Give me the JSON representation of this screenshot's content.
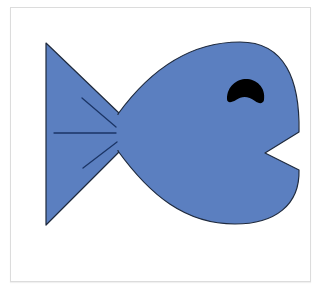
{
  "illustration": {
    "subject": "fish",
    "description": "Blue cartoon fish facing right with open mouth and black eye",
    "colors": {
      "body_fill": "#5b7fc0",
      "outline": "#1f2a3d",
      "fin_lines": "#1b3566",
      "eye": "#000000",
      "background": "#ffffff",
      "frame_border": "#dcdcdc"
    }
  }
}
